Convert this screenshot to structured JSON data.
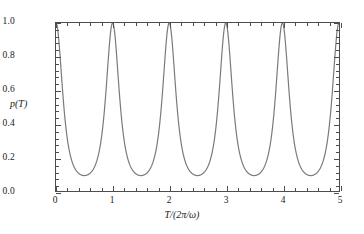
{
  "figure": {
    "background_color": "#ffffff",
    "frame_color": "#4d4d4d",
    "curve_color": "#7a7a7a",
    "text_color": "#1a1a1a"
  },
  "axes": {
    "y_title": "p(T)",
    "x_title_parts": {
      "num": "T",
      "slash": "/(2",
      "pi": "π",
      "slash2": "/",
      "omega": "ω",
      "close": ")"
    },
    "x_title_plain": "T/(2π/ω)",
    "y_ticks": [
      "0.0",
      "0.2",
      "0.4",
      "0.6",
      "0.8",
      "1.0"
    ],
    "y_tick_values": [
      0.0,
      0.2,
      0.4,
      0.6,
      0.8,
      1.0
    ],
    "x_ticks": [
      "0",
      "1",
      "2",
      "3",
      "4",
      "5"
    ],
    "x_tick_values": [
      0,
      1,
      2,
      3,
      4,
      5
    ],
    "y_minor_per_interval": 4,
    "x_minor_per_interval": 4
  },
  "chart_data": {
    "type": "line",
    "title": "",
    "subtitle": "",
    "xlabel": "T/(2π/ω)",
    "ylabel": "p(T)",
    "xlim": [
      0,
      5
    ],
    "ylim": [
      0.0,
      1.0
    ],
    "grid": false,
    "legend": null,
    "legend_position": "none",
    "xticks": [
      0,
      1,
      2,
      3,
      4,
      5
    ],
    "yticks": [
      0.0,
      0.2,
      0.4,
      0.6,
      0.8,
      1.0
    ],
    "xtick_labels": [
      "0",
      "1",
      "2",
      "3",
      "4",
      "5"
    ],
    "ytick_labels": [
      "0.0",
      "0.2",
      "0.4",
      "0.6",
      "0.8",
      "1.0"
    ],
    "series": [
      {
        "name": "p(T)",
        "color": "#7a7a7a",
        "linewidth": 1.2,
        "description": "Periodic revival probability with sharp peaks of value 1.0 at every integer T and broad minima of about 0.024 at every half-integer T.",
        "period": 1.0,
        "peak_value": 1.0,
        "minimum_value": 0.024,
        "peak_positions": [
          0,
          1,
          2,
          3,
          4,
          5
        ],
        "minimum_positions": [
          0.5,
          1.5,
          2.5,
          3.5,
          4.5
        ],
        "formula": "p(T) = 1 / (1 + k*sin^2(pi*T))^2, k = 2.3",
        "x": [
          0.0,
          0.05,
          0.1,
          0.15,
          0.2,
          0.25,
          0.3,
          0.35,
          0.4,
          0.45,
          0.5,
          0.55,
          0.6,
          0.65,
          0.7,
          0.75,
          0.8,
          0.85,
          0.9,
          0.95,
          1.0
        ],
        "y": [
          1.0,
          0.893,
          0.664,
          0.447,
          0.294,
          0.196,
          0.134,
          0.094,
          0.069,
          0.054,
          0.048,
          0.054,
          0.069,
          0.094,
          0.134,
          0.196,
          0.294,
          0.447,
          0.664,
          0.893,
          1.0
        ]
      }
    ]
  }
}
